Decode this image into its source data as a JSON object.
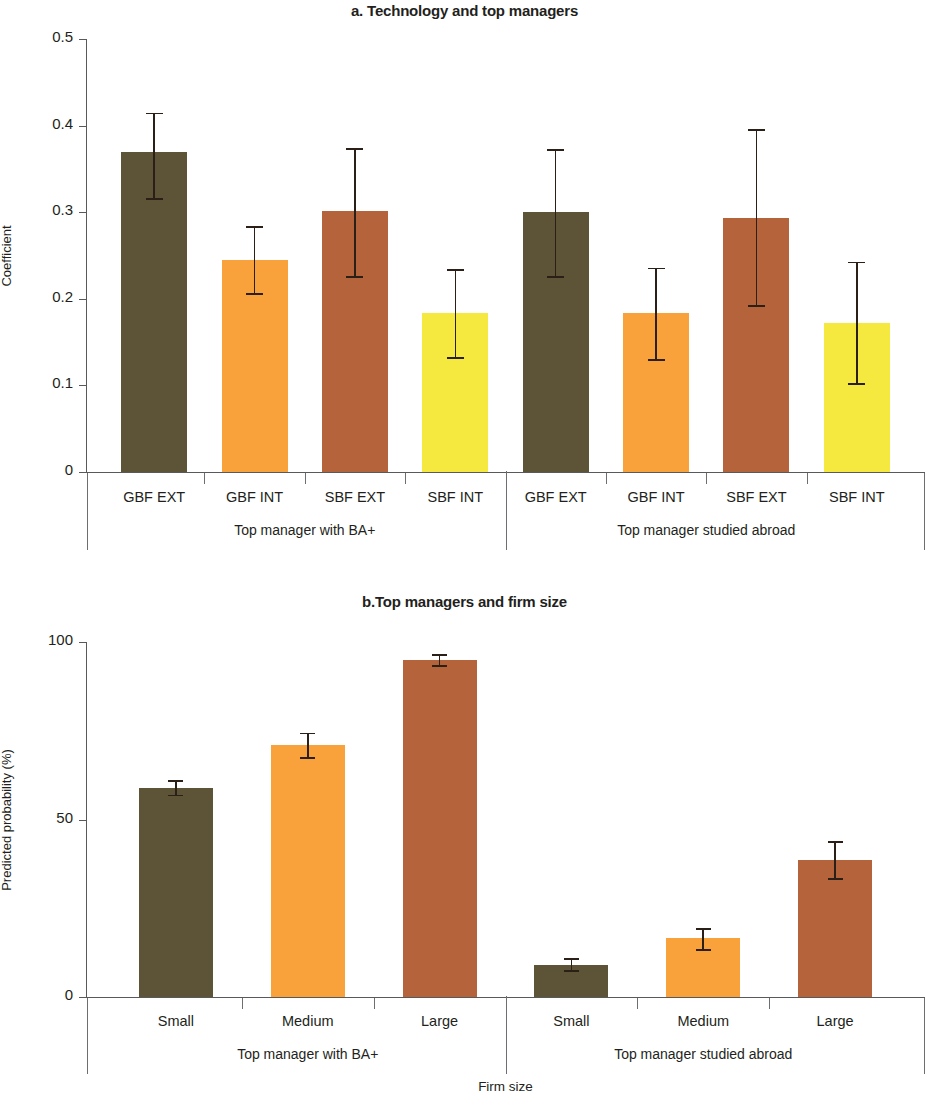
{
  "figure": {
    "panels": [
      {
        "id": "a",
        "title": "a. Technology and top managers",
        "ylabel": "Coefficient",
        "xlabel": ""
      },
      {
        "id": "b",
        "title": "b.Top managers and firm size",
        "ylabel": "Predicted probability (%)",
        "xlabel": "Firm size"
      }
    ]
  },
  "colors": {
    "dark_olive": "#5d5336",
    "orange": "#f9a council",
    "orange_fix": "#f9a13a",
    "rust": "#b5633b",
    "yellow": "#f5e93f",
    "axis": "#58595b",
    "error": "#2b2018",
    "text": "#231f20"
  },
  "chart_data": [
    {
      "type": "bar",
      "title": "a. Technology and top managers",
      "xlabel": "",
      "ylabel": "Coefficient",
      "ylim": [
        0,
        0.5
      ],
      "yticks": [
        "0",
        "0.1",
        "0.2",
        "0.3",
        "0.4",
        "0.5"
      ],
      "ytick_values": [
        0,
        0.1,
        0.2,
        0.3,
        0.4,
        0.5
      ],
      "grid": false,
      "legend": "none",
      "groups": [
        {
          "label": "Top manager with BA+",
          "categories": [
            "GBF EXT",
            "GBF INT",
            "SBF EXT",
            "SBF INT"
          ],
          "values": [
            0.369,
            0.245,
            0.301,
            0.184
          ],
          "err_low": [
            0.316,
            0.207,
            0.226,
            0.133
          ],
          "err_high": [
            0.415,
            0.284,
            0.374,
            0.234
          ],
          "colors": [
            "#5d5336",
            "#f9a13a",
            "#b5633b",
            "#f5e93f"
          ]
        },
        {
          "label": "Top manager studied abroad",
          "categories": [
            "GBF EXT",
            "GBF INT",
            "SBF EXT",
            "SBF INT"
          ],
          "values": [
            0.3,
            0.184,
            0.293,
            0.172
          ],
          "err_low": [
            0.226,
            0.13,
            0.193,
            0.103
          ],
          "err_high": [
            0.373,
            0.236,
            0.396,
            0.243
          ],
          "colors": [
            "#5d5336",
            "#f9a13a",
            "#b5633b",
            "#f5e93f"
          ]
        }
      ]
    },
    {
      "type": "bar",
      "title": "b.Top managers and firm size",
      "xlabel": "Firm size",
      "ylabel": "Predicted probability (%)",
      "ylim": [
        0,
        100
      ],
      "yticks": [
        "0",
        "50",
        "100"
      ],
      "ytick_values": [
        0,
        50,
        100
      ],
      "grid": false,
      "legend": "none",
      "groups": [
        {
          "label": "Top manager with BA+",
          "categories": [
            "Small",
            "Medium",
            "Large"
          ],
          "values": [
            59.0,
            71.0,
            95.0
          ],
          "err_low": [
            57.0,
            67.5,
            93.5
          ],
          "err_high": [
            61.0,
            74.5,
            96.5
          ],
          "colors": [
            "#5d5336",
            "#f9a13a",
            "#b5633b"
          ]
        },
        {
          "label": "Top manager studied abroad",
          "categories": [
            "Small",
            "Medium",
            "Large"
          ],
          "values": [
            9.0,
            16.5,
            38.5
          ],
          "err_low": [
            7.5,
            13.5,
            33.5
          ],
          "err_high": [
            11.0,
            19.5,
            44.0
          ],
          "colors": [
            "#5d5336",
            "#f9a13a",
            "#b5633b"
          ]
        }
      ]
    }
  ]
}
